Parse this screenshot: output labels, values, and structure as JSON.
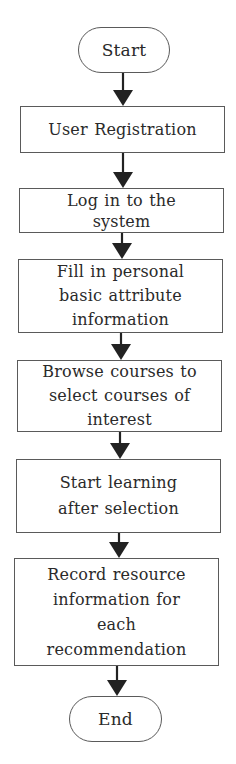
{
  "diagram": {
    "type": "flowchart",
    "direction": "top-to-bottom",
    "colors": {
      "stroke": "#5a5a5a",
      "arrow": "#222222",
      "text": "#2a2a2a",
      "background": "#ffffff"
    },
    "nodes": [
      {
        "id": "start",
        "shape": "terminal",
        "label": "Start"
      },
      {
        "id": "register",
        "shape": "process",
        "label": "User Registration"
      },
      {
        "id": "login",
        "shape": "process",
        "label": "Log in to the\nsystem"
      },
      {
        "id": "fill-info",
        "shape": "process",
        "label": "Fill in personal\nbasic attribute\ninformation"
      },
      {
        "id": "browse",
        "shape": "process",
        "label": "Browse courses to\nselect courses of\ninterest"
      },
      {
        "id": "learn",
        "shape": "process",
        "label": "Start learning\nafter selection"
      },
      {
        "id": "record",
        "shape": "process",
        "label": "Record resource\ninformation for\neach\nrecommendation"
      },
      {
        "id": "end",
        "shape": "terminal",
        "label": "End"
      }
    ],
    "edges": [
      {
        "from": "start",
        "to": "register"
      },
      {
        "from": "register",
        "to": "login"
      },
      {
        "from": "login",
        "to": "fill-info"
      },
      {
        "from": "fill-info",
        "to": "browse"
      },
      {
        "from": "browse",
        "to": "learn"
      },
      {
        "from": "learn",
        "to": "record"
      },
      {
        "from": "record",
        "to": "end"
      }
    ]
  }
}
